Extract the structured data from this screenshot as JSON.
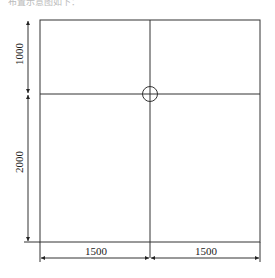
{
  "header": {
    "caption": "布置示意图如下："
  },
  "diagram": {
    "dimensions": {
      "left_top": "1000",
      "left_bottom": "2000",
      "bottom_left": "1500",
      "bottom_right": "1500"
    },
    "colors": {
      "line": "#333333",
      "background": "#ffffff"
    }
  }
}
